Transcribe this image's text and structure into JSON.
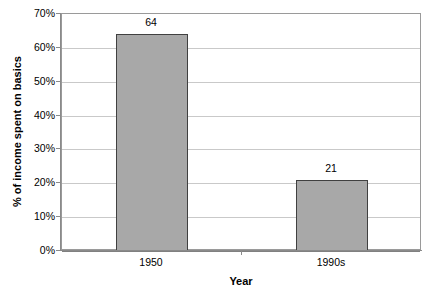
{
  "chart_data": {
    "type": "bar",
    "title": "",
    "xlabel": "Year",
    "ylabel": "% of income spent on basics",
    "categories": [
      "1950",
      "1990s"
    ],
    "values": [
      64,
      21
    ],
    "value_labels": [
      "64",
      "21"
    ],
    "ylim": [
      0,
      70
    ],
    "ytick_step": 10,
    "ytick_labels": [
      "70%",
      "60%",
      "50%",
      "40%",
      "30%",
      "20%",
      "10%",
      "0%"
    ],
    "ytick_values": [
      70,
      60,
      50,
      40,
      30,
      20,
      10,
      0
    ],
    "grid": "horizontal",
    "legend": "none",
    "series": [
      {
        "name": "% of income spent on basics",
        "values": [
          64,
          21
        ]
      }
    ],
    "colors": {
      "bar_fill": "#a8a8a8",
      "bar_border": "#404040",
      "gridline": "#c9c9c9",
      "axis": "#8a8a8a",
      "plot_border": "#9a9a9a",
      "background": "#ffffff",
      "text": "#000000"
    }
  }
}
